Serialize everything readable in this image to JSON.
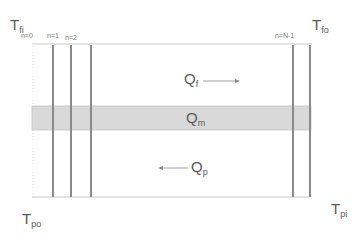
{
  "diagram": {
    "corner_labels": {
      "top_left": {
        "main": "T",
        "sub": "fi"
      },
      "top_right": {
        "main": "T",
        "sub": "fo"
      },
      "bottom_left": {
        "main": "T",
        "sub": "po"
      },
      "bottom_right": {
        "main": "T",
        "sub": "pi"
      }
    },
    "node_labels": [
      "n=0",
      "n=1",
      "n=2",
      "n=N-1"
    ],
    "flows": {
      "fluid": {
        "main": "Q",
        "sub": "f",
        "direction": "right"
      },
      "medium": {
        "main": "Q",
        "sub": "m"
      },
      "plate": {
        "main": "Q",
        "sub": "p",
        "direction": "left"
      }
    },
    "colors": {
      "band_fill": "#d9d9d9",
      "line": "#8a8a8a",
      "thin_line": "#bdbdbd",
      "text": "#5a5a5a"
    }
  }
}
